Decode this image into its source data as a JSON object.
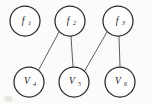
{
  "diagram": {
    "background_color": "#fbfbfa",
    "node_stroke_color": "#2a2a2a",
    "edge_color": "#4a4a4a",
    "label_color": "#1a1a1a",
    "nodes": [
      {
        "id": "f1",
        "label": "f",
        "subscript": "1",
        "cx": 25,
        "cy": 21,
        "r": 15,
        "row": "top",
        "kind": "factor"
      },
      {
        "id": "f2",
        "label": "f",
        "subscript": "2",
        "cx": 70,
        "cy": 21,
        "r": 15,
        "row": "top",
        "kind": "factor"
      },
      {
        "id": "f3",
        "label": "f",
        "subscript": "3",
        "cx": 118,
        "cy": 21,
        "r": 15,
        "row": "top",
        "kind": "factor"
      },
      {
        "id": "v4",
        "label": "V",
        "subscript": "4",
        "cx": 29,
        "cy": 82,
        "r": 15,
        "row": "bottom",
        "kind": "variable"
      },
      {
        "id": "v5",
        "label": "V",
        "subscript": "5",
        "cx": 74,
        "cy": 82,
        "r": 15,
        "row": "bottom",
        "kind": "variable"
      },
      {
        "id": "v6",
        "label": "V",
        "subscript": "6",
        "cx": 120,
        "cy": 82,
        "r": 15,
        "row": "bottom",
        "kind": "variable"
      }
    ],
    "edges": [
      {
        "id": "e1",
        "from": "f2",
        "to": "v4",
        "x1": 59,
        "y1": 32,
        "x2": 38,
        "y2": 71
      },
      {
        "id": "e2",
        "from": "f2",
        "to": "v5",
        "x1": 71,
        "y1": 36,
        "x2": 73,
        "y2": 67
      },
      {
        "id": "e3",
        "from": "f3",
        "to": "v5",
        "x1": 107,
        "y1": 32,
        "x2": 84,
        "y2": 72
      },
      {
        "id": "e4",
        "from": "f3",
        "to": "v6",
        "x1": 119,
        "y1": 36,
        "x2": 120,
        "y2": 67
      }
    ]
  }
}
